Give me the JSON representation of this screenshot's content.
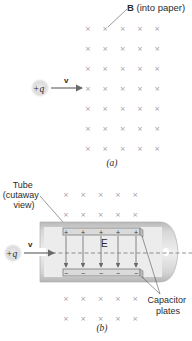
{
  "panel_a": {
    "field_label_bold": "B",
    "field_label_rest": " (into paper)",
    "charge_label": "+q",
    "velocity_label": "v",
    "caption": "(a)",
    "grid": {
      "columns": 5,
      "rows": 7,
      "x0": 88,
      "dx": 17.3,
      "y0": 28,
      "dy": 20,
      "symbol": "×"
    }
  },
  "panel_b": {
    "tube_label_line1": "Tube",
    "tube_label_line2": "(cutaway",
    "tube_label_line3": "view)",
    "charge_label": "+q",
    "velocity_label": "v",
    "field_label": "E",
    "plates_label_line1": "Capacitor",
    "plates_label_line2": "plates",
    "top_plate_sign": "+",
    "bottom_plate_sign": "−",
    "caption": "(b)",
    "grid_top": {
      "columns": 5,
      "rows": 2,
      "x0": 66,
      "dx": 17.3,
      "y0": 194,
      "dy": 20,
      "symbol": "×"
    },
    "grid_bottom": {
      "columns": 5,
      "rows": 2,
      "x0": 66,
      "dx": 17.3,
      "y0": 298,
      "dy": 20,
      "symbol": "×"
    }
  },
  "colors": {
    "cross": "#9a9a9a",
    "tube_fill": "#c8c8c8",
    "tube_inner": "#e9e9e9",
    "plate_fill": "#d9d9d9",
    "arrow": "#6a6a6a",
    "text": "#2b2b2b"
  }
}
